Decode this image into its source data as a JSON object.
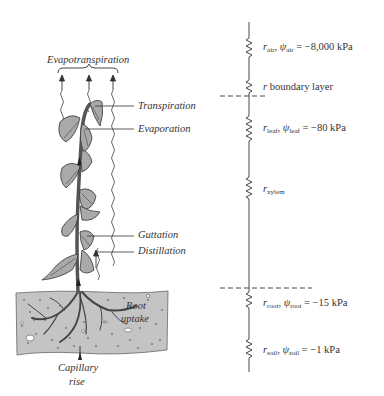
{
  "diagram": {
    "plant": {
      "top_label": "Evapotranspiration",
      "labels": {
        "transpiration": "Transpiration",
        "evaporation": "Evaporation",
        "guttation": "Guttation",
        "distillation": "Distillation",
        "root_uptake_line1": "Root",
        "root_uptake_line2": "uptake",
        "capillary_line1": "Capillary",
        "capillary_line2": "rise"
      }
    },
    "circuit": {
      "resistances": [
        {
          "id": "air",
          "r": "r",
          "r_sub": "air",
          "psi": "ψ",
          "psi_sub": "air",
          "value": "= −8,000 kPa"
        },
        {
          "id": "boundary",
          "text": "r boundary layer"
        },
        {
          "id": "leaf",
          "r": "r",
          "r_sub": "leaf",
          "psi": "ψ",
          "psi_sub": "leaf",
          "value": "= −80 kPa"
        },
        {
          "id": "xylem",
          "r": "r",
          "r_sub": "xylem"
        },
        {
          "id": "root",
          "r": "r",
          "r_sub": "root",
          "psi": "ψ",
          "psi_sub": "root",
          "value": "= −15 kPa"
        },
        {
          "id": "soil",
          "r": "r",
          "r_sub": "soil",
          "psi": "ψ",
          "psi_sub": "soil",
          "value": "= −1 kPa"
        }
      ],
      "boundary_r_italic": "r",
      "boundary_text": " boundary layer"
    },
    "colors": {
      "ink": "#333333",
      "leaf_fill": "#a9a9a9",
      "stem": "#555555",
      "soil_fill": "#c4c4c4",
      "background": "#ffffff"
    }
  }
}
